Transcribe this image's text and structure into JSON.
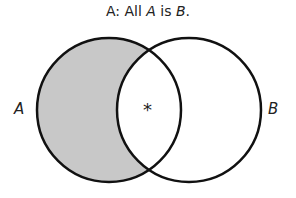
{
  "title": {
    "prefix": "A:  All ",
    "term1": "A",
    "middle": " is ",
    "term2": "B",
    "suffix": "."
  },
  "diagram": {
    "type": "venn",
    "statement": "All A is B.",
    "circles": [
      {
        "label": "A",
        "cx": 109,
        "cy": 110,
        "r": 72
      },
      {
        "label": "B",
        "cx": 189,
        "cy": 110,
        "r": 72
      }
    ],
    "shaded_region": "A only (A not B)",
    "shade_color": "#c8c8c8",
    "marker": "*",
    "marker_region": "A and B"
  },
  "labels": {
    "a": "A",
    "b": "B",
    "marker": "*"
  }
}
